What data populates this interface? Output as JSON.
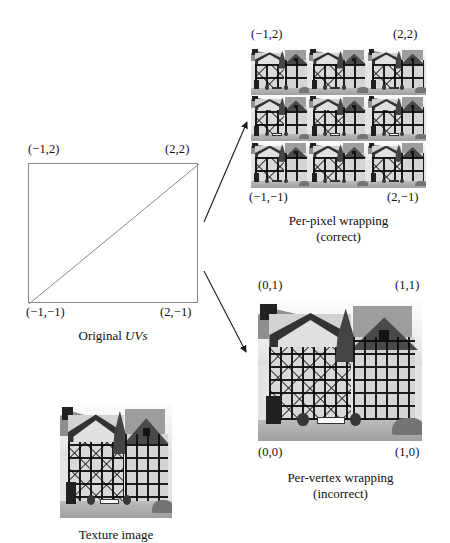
{
  "figure": {
    "background_color": "#ffffff",
    "ink_color": "#111111",
    "rule_color": "#8a8a8a"
  },
  "uv_quad": {
    "name": "Original UVs",
    "caption": "Original ",
    "caption_italic": "UVs",
    "corners": {
      "top_left": "(−1,2)",
      "top_right": "(2,2)",
      "bottom_left": "(−1,−1)",
      "bottom_right": "(2,−1)"
    },
    "diagonal": "bottom-left to top-right"
  },
  "per_pixel": {
    "corners": {
      "top_left": "(−1,2)",
      "top_right": "(2,2)",
      "bottom_left": "(−1,−1)",
      "bottom_right": "(2,−1)"
    },
    "caption_line1": "Per-pixel wrapping",
    "caption_line2": "(correct)",
    "tiles_across": 3,
    "tiles_down": 3
  },
  "per_vertex": {
    "corners": {
      "top_left": "(0,1)",
      "top_right": "(1,1)",
      "bottom_left": "(0,0)",
      "bottom_right": "(1,0)"
    },
    "caption_line1": "Per-vertex wrapping",
    "caption_line2": "(incorrect)"
  },
  "texture": {
    "caption": "Texture image",
    "subject": "black-and-white photograph of half-timbered German houses"
  },
  "arrows": [
    {
      "name": "arrow-to-per-pixel",
      "from": "uv-quad right edge",
      "to": "per-pixel tiled block",
      "direction": "up-right"
    },
    {
      "name": "arrow-to-per-vertex",
      "from": "uv-quad right edge",
      "to": "per-vertex image",
      "direction": "down-right"
    }
  ]
}
